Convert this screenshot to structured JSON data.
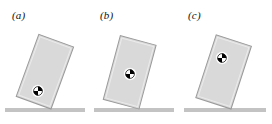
{
  "figure": {
    "type": "physics-diagram",
    "background_color": "#ffffff",
    "width": 272,
    "height": 124
  },
  "style": {
    "block_fill": "#d9d9d9",
    "block_stroke": "#9a9a9a",
    "block_highlight": "#e6e6e6",
    "ground_color": "#c3c3c3",
    "label_color": "#111111",
    "com_dark": "#000000",
    "com_light": "#ffffff"
  },
  "panels": [
    {
      "id": "a",
      "label": "(a)",
      "label_x": 12,
      "label_y": 10,
      "panel_left": 0,
      "panel_width": 88,
      "block": {
        "tilt_deg": 20,
        "pivot_x": 51,
        "pivot_y": 109,
        "width": 37,
        "height": 66
      },
      "ground": {
        "x": 5,
        "y": 108,
        "width": 80,
        "height": 4
      },
      "com": {
        "x": 38,
        "y": 91,
        "radius": 4.6,
        "name": "center-of-mass-marker"
      }
    },
    {
      "id": "b",
      "label": "(b)",
      "label_x": 100,
      "label_y": 10,
      "panel_left": 88,
      "panel_width": 88,
      "block": {
        "tilt_deg": 15,
        "pivot_x": 139,
        "pivot_y": 109,
        "width": 37,
        "height": 66
      },
      "ground": {
        "x": 94,
        "y": 108,
        "width": 80,
        "height": 4
      },
      "com": {
        "x": 130,
        "y": 74,
        "radius": 4.6,
        "name": "center-of-mass-marker"
      }
    },
    {
      "id": "c",
      "label": "(c)",
      "label_x": 188,
      "label_y": 10,
      "panel_left": 176,
      "panel_width": 96,
      "block": {
        "tilt_deg": 18,
        "pivot_x": 231,
        "pivot_y": 109,
        "width": 37,
        "height": 66
      },
      "ground": {
        "x": 184,
        "y": 108,
        "width": 82,
        "height": 4
      },
      "com": {
        "x": 222,
        "y": 58,
        "radius": 4.6,
        "name": "center-of-mass-marker"
      }
    }
  ]
}
